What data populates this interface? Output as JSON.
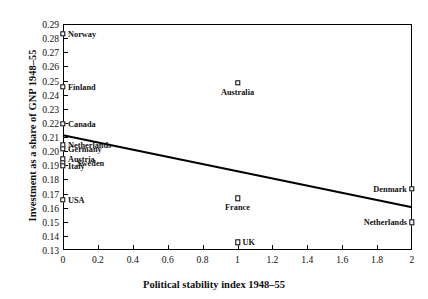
{
  "chart_data": {
    "type": "scatter",
    "title": "",
    "xlabel": "Political stability index 1948–55",
    "ylabel": "Investment as a share of GNP 1948–55",
    "xlim": [
      0,
      2
    ],
    "ylim": [
      0.13,
      0.29
    ],
    "xticks": [
      "0",
      "0.2",
      "0.4",
      "0.6",
      "0.8",
      "1",
      "1.2",
      "1.4",
      "1.6",
      "1.8",
      "2"
    ],
    "xtick_values": [
      0,
      0.2,
      0.4,
      0.6,
      0.8,
      1.0,
      1.2,
      1.4,
      1.6,
      1.8,
      2.0
    ],
    "yticks": [
      "0.13",
      "0.14",
      "0.15",
      "0.16",
      "0.17",
      "0.18",
      "0.19",
      "0.20",
      "0.21",
      "0.22",
      "0.23",
      "0.24",
      "0.25",
      "0.26",
      "0.27",
      "0.28",
      "0.29"
    ],
    "ytick_values": [
      0.13,
      0.14,
      0.15,
      0.16,
      0.17,
      0.18,
      0.19,
      0.2,
      0.21,
      0.22,
      0.23,
      0.24,
      0.25,
      0.26,
      0.27,
      0.28,
      0.29
    ],
    "grid": false,
    "legend": "none",
    "marker": "open-square",
    "points": [
      {
        "label": "Norway",
        "x": 0.0,
        "y": 0.283,
        "label_pos": "right"
      },
      {
        "label": "Finland",
        "x": 0.0,
        "y": 0.2455,
        "label_pos": "right"
      },
      {
        "label": "Canada",
        "x": 0.0,
        "y": 0.2195,
        "label_pos": "right"
      },
      {
        "label": "Netherlands",
        "x": 0.0,
        "y": 0.204,
        "label_pos": "right"
      },
      {
        "label": "Germany",
        "x": 0.0,
        "y": 0.2015,
        "label_pos": "right"
      },
      {
        "label": "Austria",
        "x": 0.0,
        "y": 0.1945,
        "label_pos": "right"
      },
      {
        "label": "Sweden",
        "x": 0.0,
        "y": 0.1915,
        "label_pos": "right-offset"
      },
      {
        "label": "Italy",
        "x": 0.0,
        "y": 0.1895,
        "label_pos": "right"
      },
      {
        "label": "USA",
        "x": 0.0,
        "y": 0.1655,
        "label_pos": "right"
      },
      {
        "label": "Australia",
        "x": 1.0,
        "y": 0.2485,
        "label_pos": "below"
      },
      {
        "label": "France",
        "x": 1.0,
        "y": 0.1665,
        "label_pos": "below"
      },
      {
        "label": "UK",
        "x": 1.0,
        "y": 0.1355,
        "label_pos": "right"
      },
      {
        "label": "Denmark",
        "x": 2.0,
        "y": 0.1735,
        "label_pos": "left"
      },
      {
        "label": "Netherlands",
        "x": 2.0,
        "y": 0.1495,
        "label_pos": "left"
      }
    ],
    "fit_line": {
      "name": "regression-line",
      "x1": 0.0,
      "y1": 0.2112,
      "x2": 2.0,
      "y2": 0.1602,
      "color": "#000000"
    },
    "axis_color": "#000000"
  }
}
